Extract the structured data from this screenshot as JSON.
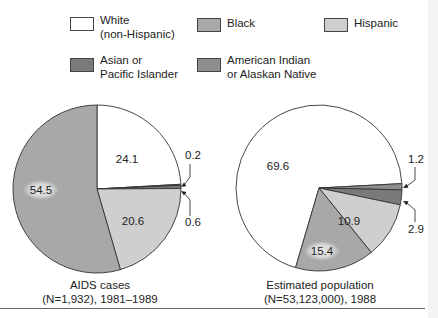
{
  "legend": [
    {
      "label": "White\n(non-Hispanic)",
      "color": "#ffffff"
    },
    {
      "label": "Black",
      "color": "#a8a8a8"
    },
    {
      "label": "Hispanic",
      "color": "#cfcfcf"
    },
    {
      "label": "Asian or\nPacific Islander",
      "color": "#7a7a7a"
    },
    {
      "label": "American Indian\nor Alaskan Native",
      "color": "#8e8e8e"
    }
  ],
  "captions": {
    "left": "AIDS cases\n(N=1,932), 1981–1989",
    "right": "Estimated population\n(N=53,123,000), 1988"
  },
  "chart_data": [
    {
      "type": "pie",
      "title": "AIDS cases (N=1,932), 1981–1989",
      "categories": [
        "White (non-Hispanic)",
        "American Indian or Alaskan Native",
        "Asian or Pacific Islander",
        "Hispanic",
        "Black"
      ],
      "values": [
        24.1,
        0.2,
        0.6,
        20.6,
        54.5
      ],
      "unit": "percent",
      "labels": [
        "24.1",
        "0.2",
        "0.6",
        "20.6",
        "54.5"
      ]
    },
    {
      "type": "pie",
      "title": "Estimated population (N=53,123,000), 1988",
      "categories": [
        "White (non-Hispanic)",
        "American Indian or Alaskan Native",
        "Asian or Pacific Islander",
        "Hispanic",
        "Black"
      ],
      "values": [
        69.6,
        1.2,
        2.9,
        10.9,
        15.4
      ],
      "unit": "percent",
      "labels": [
        "69.6",
        "1.2",
        "2.9",
        "10.9",
        "15.4"
      ]
    }
  ]
}
